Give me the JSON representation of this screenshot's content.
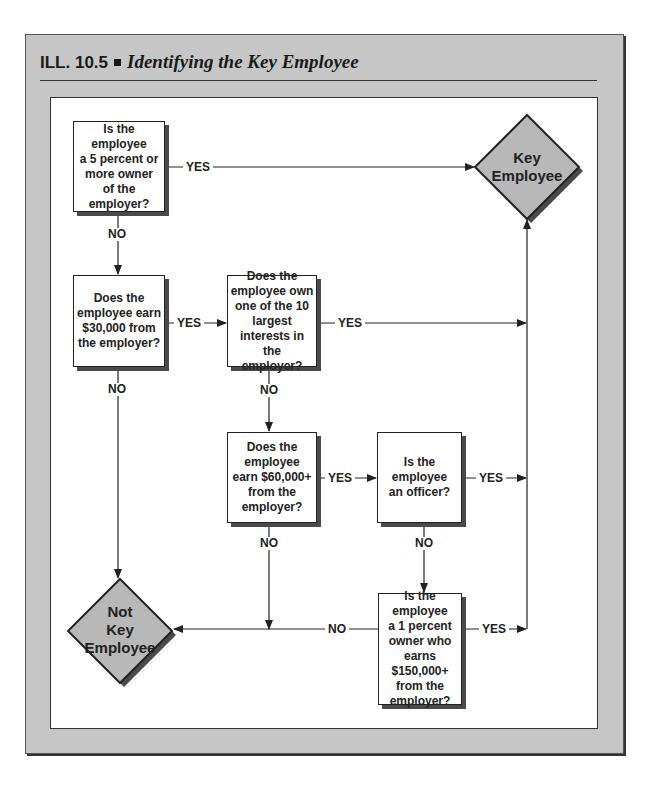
{
  "header": {
    "label": "ILL. 10.5",
    "title": "Identifying the Key Employee"
  },
  "nodes": {
    "q1": {
      "lines": [
        "Is the",
        "employee",
        "a 5 percent or",
        "more owner",
        "of the",
        "employer?"
      ]
    },
    "q2": {
      "lines": [
        "Does the",
        "employee earn",
        "$30,000 from",
        "the employer?"
      ]
    },
    "q3": {
      "lines": [
        "Does the",
        "employee own",
        "one of the 10",
        "largest",
        "interests in the",
        "employer?"
      ]
    },
    "q4": {
      "lines": [
        "Does the",
        "employee",
        "earn $60,000+",
        "from the",
        "employer?"
      ]
    },
    "q5": {
      "lines": [
        "Is the",
        "employee",
        "an officer?"
      ]
    },
    "q6": {
      "lines": [
        "Is the",
        "employee",
        "a 1 percent",
        "owner who",
        "earns",
        "$150,000+",
        "from the",
        "employer?"
      ]
    },
    "key": {
      "lines": [
        "Key",
        "Employee"
      ]
    },
    "not_key": {
      "lines": [
        "Not",
        "Key",
        "Employee"
      ]
    }
  },
  "edges": {
    "q1_yes": "YES",
    "q1_no": "NO",
    "q2_yes": "YES",
    "q2_no": "NO",
    "q3_yes": "YES",
    "q3_no": "NO",
    "q4_yes": "YES",
    "q4_no": "NO",
    "q5_yes": "YES",
    "q5_no": "NO",
    "q6_yes": "YES",
    "q6_no": "NO"
  },
  "colors": {
    "frame": "#c6c6c6",
    "diamond_fill": "#b8b8b8",
    "shadow": "#4a4a4a",
    "line": "#222222"
  }
}
